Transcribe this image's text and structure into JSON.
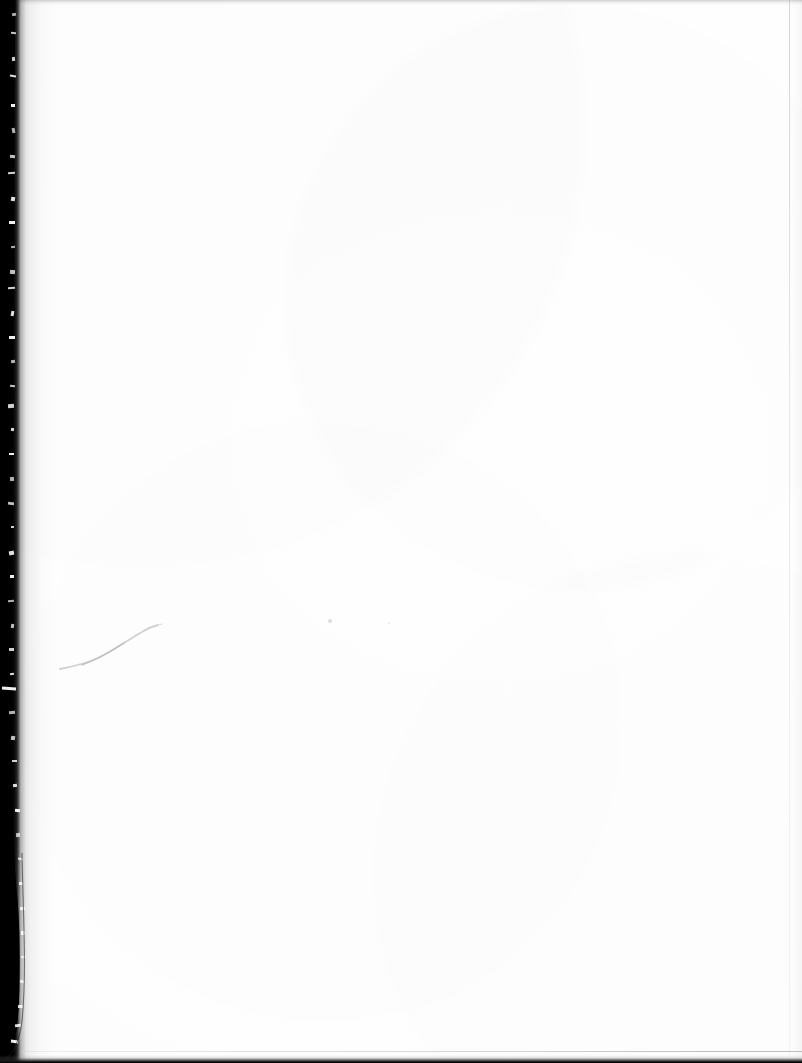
{
  "document": {
    "kind": "scanned-page",
    "content_type": "blank-page",
    "visible_text": "",
    "page_width": 802,
    "page_height": 1063,
    "background_color": "#ffffff"
  },
  "artifacts": {
    "gutter": {
      "name": "binding-gutter-shadow",
      "side": "left",
      "color": "#000000",
      "edge_style": "ragged",
      "min_width_px": 11,
      "max_width_px": 20
    },
    "top_band": {
      "name": "top-edge-band",
      "color": "#96969b",
      "height_px": 5
    },
    "right_line": {
      "name": "right-edge-line",
      "color": "#aaaaaf",
      "x_px": 789
    },
    "bottom_line": {
      "name": "bottom-edge-line",
      "color": "#000000",
      "height_px": 7
    },
    "crease": {
      "name": "crease-stroke",
      "color": "#c8c8cd",
      "start": "72,667",
      "end": "150,629"
    },
    "specks": [
      {
        "name": "speck-a",
        "x": 328,
        "y": 619,
        "color": "#969699"
      },
      {
        "name": "speck-b",
        "x": 388,
        "y": 622,
        "color": "#a5a5ac"
      }
    ],
    "flecks": [
      {
        "top_pct": 1.2,
        "left": 12,
        "w": 4,
        "h": 3
      },
      {
        "top_pct": 3.0,
        "left": 11,
        "w": 5,
        "h": 2
      },
      {
        "top_pct": 5.4,
        "left": 12,
        "w": 3,
        "h": 4
      },
      {
        "top_pct": 7.1,
        "left": 10,
        "w": 6,
        "h": 2
      },
      {
        "top_pct": 9.8,
        "left": 11,
        "w": 4,
        "h": 3
      },
      {
        "top_pct": 12.0,
        "left": 12,
        "w": 3,
        "h": 5
      },
      {
        "top_pct": 14.6,
        "left": 10,
        "w": 5,
        "h": 3
      },
      {
        "top_pct": 16.2,
        "left": 8,
        "w": 7,
        "h": 2
      },
      {
        "top_pct": 18.5,
        "left": 11,
        "w": 4,
        "h": 4
      },
      {
        "top_pct": 20.8,
        "left": 9,
        "w": 6,
        "h": 3
      },
      {
        "top_pct": 23.1,
        "left": 11,
        "w": 4,
        "h": 2
      },
      {
        "top_pct": 25.4,
        "left": 10,
        "w": 5,
        "h": 4
      },
      {
        "top_pct": 27.0,
        "left": 8,
        "w": 7,
        "h": 2
      },
      {
        "top_pct": 29.3,
        "left": 11,
        "w": 3,
        "h": 5
      },
      {
        "top_pct": 31.6,
        "left": 9,
        "w": 6,
        "h": 3
      },
      {
        "top_pct": 33.9,
        "left": 11,
        "w": 4,
        "h": 3
      },
      {
        "top_pct": 36.2,
        "left": 10,
        "w": 5,
        "h": 2
      },
      {
        "top_pct": 38.0,
        "left": 8,
        "w": 6,
        "h": 4
      },
      {
        "top_pct": 40.3,
        "left": 11,
        "w": 3,
        "h": 3
      },
      {
        "top_pct": 42.6,
        "left": 9,
        "w": 5,
        "h": 2
      },
      {
        "top_pct": 44.9,
        "left": 10,
        "w": 4,
        "h": 4
      },
      {
        "top_pct": 47.2,
        "left": 8,
        "w": 6,
        "h": 3
      },
      {
        "top_pct": 49.5,
        "left": 11,
        "w": 3,
        "h": 2
      },
      {
        "top_pct": 51.8,
        "left": 9,
        "w": 5,
        "h": 4
      },
      {
        "top_pct": 54.1,
        "left": 10,
        "w": 4,
        "h": 3
      },
      {
        "top_pct": 56.4,
        "left": 8,
        "w": 6,
        "h": 2
      },
      {
        "top_pct": 58.7,
        "left": 11,
        "w": 3,
        "h": 4
      },
      {
        "top_pct": 61.0,
        "left": 9,
        "w": 5,
        "h": 3
      },
      {
        "top_pct": 63.3,
        "left": 10,
        "w": 4,
        "h": 2
      },
      {
        "top_pct": 64.6,
        "left": 2,
        "w": 14,
        "h": 3
      },
      {
        "top_pct": 66.9,
        "left": 9,
        "w": 6,
        "h": 3
      },
      {
        "top_pct": 69.2,
        "left": 11,
        "w": 4,
        "h": 4
      },
      {
        "top_pct": 71.5,
        "left": 12,
        "w": 5,
        "h": 2
      },
      {
        "top_pct": 73.8,
        "left": 13,
        "w": 4,
        "h": 3
      },
      {
        "top_pct": 76.1,
        "left": 15,
        "w": 5,
        "h": 3
      },
      {
        "top_pct": 78.4,
        "left": 16,
        "w": 4,
        "h": 4
      },
      {
        "top_pct": 80.7,
        "left": 18,
        "w": 5,
        "h": 2
      },
      {
        "top_pct": 83.0,
        "left": 19,
        "w": 4,
        "h": 3
      },
      {
        "top_pct": 85.3,
        "left": 20,
        "w": 5,
        "h": 3
      },
      {
        "top_pct": 87.6,
        "left": 21,
        "w": 4,
        "h": 4
      },
      {
        "top_pct": 89.9,
        "left": 21,
        "w": 5,
        "h": 2
      },
      {
        "top_pct": 92.2,
        "left": 20,
        "w": 4,
        "h": 3
      },
      {
        "top_pct": 94.5,
        "left": 18,
        "w": 5,
        "h": 3
      },
      {
        "top_pct": 96.3,
        "left": 15,
        "w": 6,
        "h": 3
      },
      {
        "top_pct": 97.8,
        "left": 11,
        "w": 7,
        "h": 3
      }
    ]
  }
}
